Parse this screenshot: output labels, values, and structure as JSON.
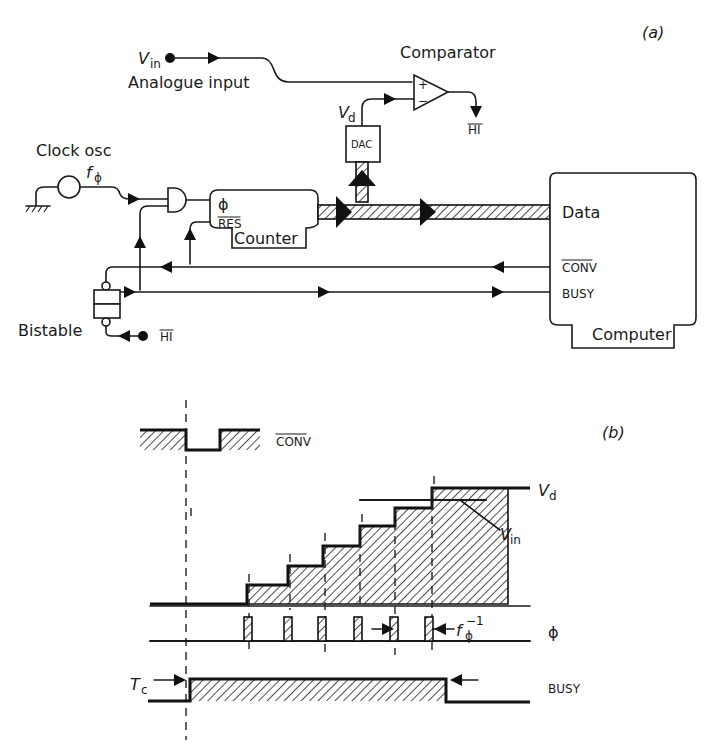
{
  "part_a": {
    "label": "(a)",
    "analogue_input": {
      "symbol": "V",
      "subscript": "in",
      "label": "Analogue input"
    },
    "comparator": {
      "label": "Comparator",
      "plus": "+",
      "minus": "−",
      "output": "HI"
    },
    "dac": {
      "label": "DAC",
      "output_symbol": "V",
      "output_subscript": "d"
    },
    "clock": {
      "label": "Clock osc",
      "symbol": "f",
      "subscript": "ϕ"
    },
    "counter": {
      "label": "Counter",
      "clock_input": "ϕ",
      "reset_input": "RES"
    },
    "bistable": {
      "label": "Bistable",
      "input": "HI"
    },
    "computer": {
      "label": "Computer",
      "ports": {
        "data": "Data",
        "conv": "CONV",
        "busy": "BUSY"
      }
    }
  },
  "part_b": {
    "label": "(b)",
    "signals": {
      "conv": "CONV",
      "vd": {
        "symbol": "V",
        "subscript": "d"
      },
      "vin": {
        "symbol": "V",
        "subscript": "in"
      },
      "phi": "ϕ",
      "clock_period": {
        "symbol": "f",
        "subscript": "ϕ",
        "superscript": "−1"
      },
      "busy": "BUSY",
      "conversion_time": {
        "symbol": "T",
        "subscript": "c"
      }
    },
    "staircase_steps": 6,
    "clock_pulses": 6
  }
}
